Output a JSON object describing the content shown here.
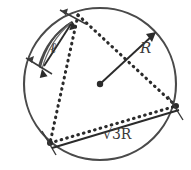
{
  "figure": {
    "title": "Circle with inscribed dotted triangle, radius and chord annotations",
    "canvas": {
      "width": 191,
      "height": 170,
      "background": "#ffffff"
    },
    "colors": {
      "stroke": "#4a4a4a",
      "dotted": "#2b2b2b",
      "label": "#3a3a3a",
      "background": "#ffffff"
    },
    "labels": {
      "chord_length": "ℓ",
      "radius": "R",
      "side_length_prefix": "√",
      "side_length_radicand": "3R",
      "side_length_full": "√3R"
    },
    "geometry": {
      "circle": {
        "cx": 100,
        "cy": 84,
        "r": 76
      },
      "center_point": {
        "x": 100,
        "y": 84
      },
      "triangle_vertices": [
        {
          "name": "top",
          "x": 78,
          "y": 15
        },
        {
          "name": "bottom-left",
          "x": 50,
          "y": 143
        },
        {
          "name": "right",
          "x": 176,
          "y": 106
        }
      ],
      "radius_arrow": {
        "from_x": 100,
        "from_y": 84,
        "to_x": 155,
        "to_y": 33
      },
      "chord_arrow": {
        "from_x": 42,
        "from_y": 68,
        "to_x": 72,
        "to_y": 22
      },
      "chord_endpoints": [
        {
          "x": 72,
          "y": 22
        },
        {
          "x": 42,
          "y": 68
        }
      ],
      "base_line": {
        "from_x": 52,
        "from_y": 147,
        "to_x": 178,
        "to_y": 109
      }
    }
  }
}
